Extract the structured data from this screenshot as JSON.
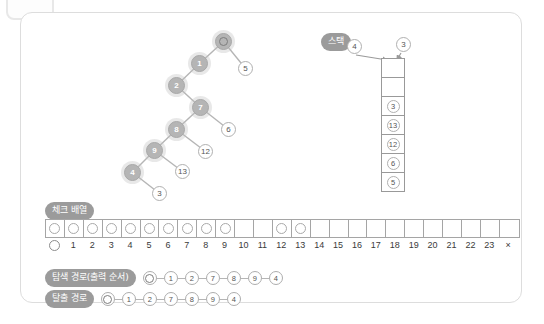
{
  "panel": {
    "name": "dfs-visualization-panel"
  },
  "tree": {
    "title": "depth-first-search-tree",
    "nodes": [
      {
        "id": "root",
        "label": "circle-glyph",
        "state": "visited",
        "x": 94,
        "y": 4,
        "is_ring": true
      },
      {
        "id": "1",
        "label": "1",
        "state": "visited",
        "x": 70,
        "y": 26,
        "is_ring": false
      },
      {
        "id": "5",
        "label": "5",
        "state": "plain",
        "x": 117,
        "y": 32,
        "is_ring": false
      },
      {
        "id": "2",
        "label": "2",
        "state": "visited",
        "x": 47,
        "y": 48,
        "is_ring": false
      },
      {
        "id": "7",
        "label": "7",
        "state": "visited",
        "x": 71,
        "y": 70,
        "is_ring": false
      },
      {
        "id": "6",
        "label": "6",
        "state": "plain",
        "x": 100,
        "y": 93,
        "is_ring": false
      },
      {
        "id": "8",
        "label": "8",
        "state": "visited",
        "x": 47,
        "y": 92,
        "is_ring": false
      },
      {
        "id": "12",
        "label": "12",
        "state": "plain",
        "x": 77,
        "y": 115,
        "is_ring": false
      },
      {
        "id": "9",
        "label": "9",
        "state": "visited",
        "x": 25,
        "y": 113,
        "is_ring": false
      },
      {
        "id": "13",
        "label": "13",
        "state": "plain",
        "x": 54,
        "y": 135,
        "is_ring": false
      },
      {
        "id": "4",
        "label": "4",
        "state": "visited",
        "x": 3,
        "y": 135,
        "is_ring": false
      },
      {
        "id": "3",
        "label": "3",
        "state": "plain",
        "x": 31,
        "y": 157,
        "is_ring": false
      }
    ],
    "edges": [
      [
        102.5,
        12.5,
        78.5,
        34.5
      ],
      [
        102.5,
        12.5,
        124.5,
        39.5
      ],
      [
        78.5,
        34.5,
        55.5,
        56.5
      ],
      [
        55.5,
        56.5,
        79.5,
        78.5
      ],
      [
        79.5,
        78.5,
        107.5,
        100.5
      ],
      [
        79.5,
        78.5,
        55.5,
        100.5
      ],
      [
        55.5,
        100.5,
        84.5,
        122.5
      ],
      [
        55.5,
        100.5,
        33.5,
        121.5
      ],
      [
        33.5,
        121.5,
        61.5,
        142.5
      ],
      [
        33.5,
        121.5,
        11.5,
        143.5
      ],
      [
        11.5,
        143.5,
        38.5,
        164.5
      ]
    ]
  },
  "stack": {
    "label": "스택",
    "incoming_nodes": [
      {
        "label": "4",
        "x": 26,
        "y": 8
      },
      {
        "label": "3",
        "x": 75,
        "y": 6
      },
      {
        "label": "arrow-4",
        "x": 0,
        "y": 0
      }
    ],
    "arrows": [
      {
        "from_x": 35,
        "from_y": 24,
        "to_x": 66,
        "to_y": 29
      },
      {
        "from_x": 80,
        "from_y": 22,
        "to_x": 76,
        "to_y": 29
      }
    ],
    "cells": [
      "",
      "",
      "3",
      "13",
      "12",
      "6",
      "5"
    ]
  },
  "check_array": {
    "label": "체크 배열",
    "labels": [
      "○",
      "1",
      "2",
      "3",
      "4",
      "5",
      "6",
      "7",
      "8",
      "9",
      "10",
      "11",
      "12",
      "13",
      "14",
      "15",
      "16",
      "17",
      "18",
      "19",
      "20",
      "21",
      "22",
      "23",
      "×"
    ],
    "checked": [
      true,
      true,
      true,
      true,
      true,
      true,
      true,
      true,
      true,
      true,
      false,
      false,
      true,
      true,
      false,
      false,
      false,
      false,
      false,
      false,
      false,
      false,
      false,
      false,
      false
    ]
  },
  "paths": [
    {
      "label": "탐색 경로(출력 순서)",
      "sequence": [
        "○",
        "1",
        "2",
        "7",
        "8",
        "9",
        "4"
      ]
    },
    {
      "label": "탈출 경로",
      "sequence": [
        "○",
        "1",
        "2",
        "7",
        "8",
        "9",
        "4"
      ]
    }
  ],
  "colors": {
    "panel_border": "#dddddd",
    "badge_bg": "#9b9b9b",
    "visited_node": "#b5b5b5",
    "plain_node": "#ffffff",
    "line": "#b5b5b5"
  }
}
